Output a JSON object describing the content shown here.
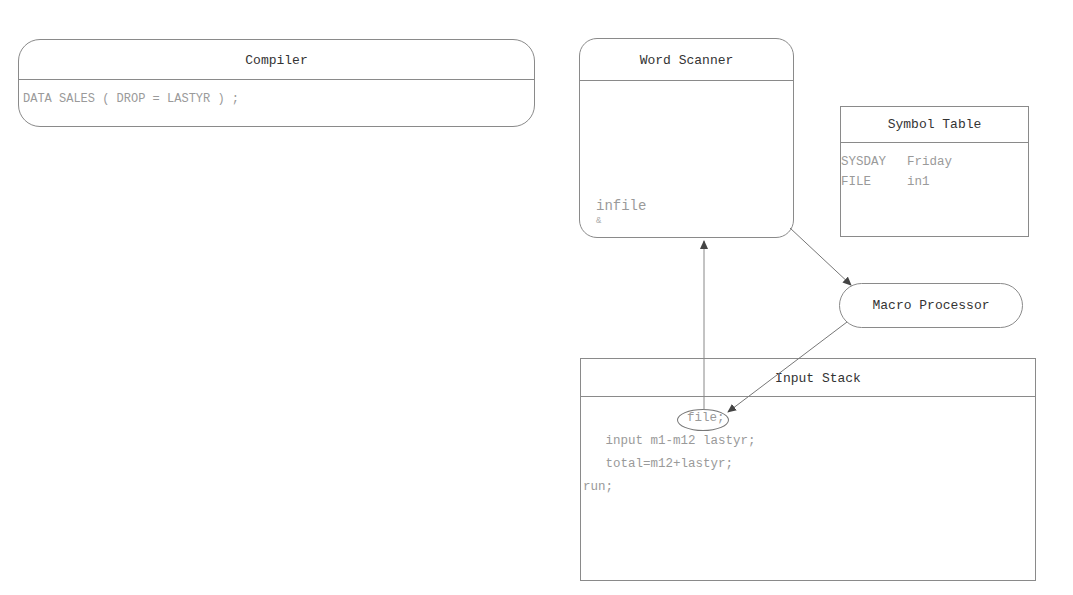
{
  "compiler": {
    "title": "Compiler",
    "content": "DATA SALES ( DROP = LASTYR ) ;"
  },
  "word_scanner": {
    "title": "Word Scanner",
    "current_token": "infile",
    "cursor_mark": "&"
  },
  "symbol_table": {
    "title": "Symbol Table",
    "rows": [
      {
        "name": "SYSDAY",
        "value": "Friday"
      },
      {
        "name": "FILE",
        "value": "in1"
      }
    ]
  },
  "macro_processor": {
    "title": "Macro Processor"
  },
  "input_stack": {
    "title": "Input Stack",
    "lines": [
      "file;",
      "   input m1-m12 lastyr;",
      "   total=m12+lastyr;",
      "run;"
    ]
  },
  "arrows": [
    {
      "from": "input_stack",
      "to": "word_scanner"
    },
    {
      "from": "word_scanner",
      "to": "macro_processor"
    },
    {
      "from": "macro_processor",
      "to": "input_stack"
    }
  ]
}
